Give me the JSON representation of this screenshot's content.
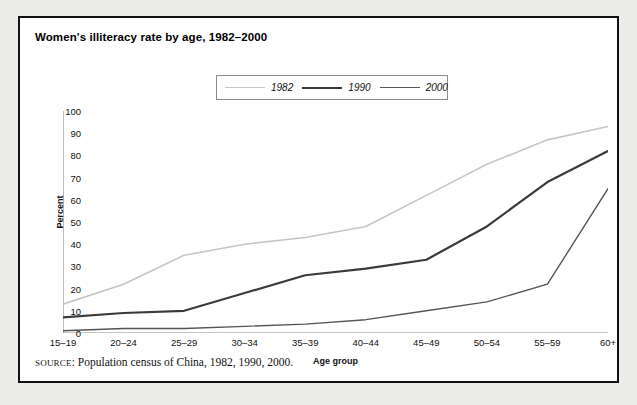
{
  "figure": {
    "title": "Women's illiteracy rate by age, 1982–2000",
    "source_prefix": "SOURCE",
    "source_text": ": Population census of China, 1982, 1990, 2000.",
    "panel_border_color": "#121212",
    "background_color": "#ececeb",
    "panel_color": "#ffffff"
  },
  "legend": {
    "position": "top-center",
    "border_color": "#8d8d8d",
    "entries": [
      {
        "label": "1982",
        "color": "#c6c6c6",
        "width": 1.6
      },
      {
        "label": "1990",
        "color": "#3a3a3a",
        "width": 2.2
      },
      {
        "label": "2000",
        "color": "#555555",
        "width": 1.4
      }
    ]
  },
  "chart_data": {
    "type": "line",
    "title": "Women's illiteracy rate by age, 1982–2000",
    "xlabel": "Age group",
    "ylabel": "Percent",
    "categories": [
      "15–19",
      "20–24",
      "25–29",
      "30–34",
      "35–39",
      "40–44",
      "45–49",
      "50–54",
      "55–59",
      "60+"
    ],
    "ylim": [
      0,
      100
    ],
    "yticks": [
      0,
      10,
      20,
      30,
      40,
      50,
      60,
      70,
      80,
      90,
      100
    ],
    "grid": false,
    "legend_position": "top-center",
    "series": [
      {
        "name": "1982",
        "color": "#c6c6c6",
        "width": 1.6,
        "values": [
          13,
          22,
          35,
          40,
          43,
          48,
          62,
          76,
          87,
          93
        ]
      },
      {
        "name": "1990",
        "color": "#3a3a3a",
        "width": 2.2,
        "values": [
          7,
          9,
          10,
          18,
          26,
          29,
          33,
          48,
          68,
          82
        ]
      },
      {
        "name": "2000",
        "color": "#555555",
        "width": 1.4,
        "values": [
          1,
          2,
          2,
          3,
          4,
          6,
          10,
          14,
          22,
          65
        ]
      }
    ]
  }
}
